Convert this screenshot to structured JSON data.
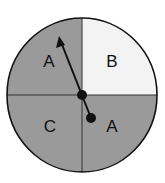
{
  "spinner": {
    "colors": {
      "shaded": "#9a9a9a",
      "light": "#f3f3f3",
      "stroke": "#111111"
    },
    "sections": [
      {
        "position": "top-left",
        "label": "A",
        "shaded": true
      },
      {
        "position": "top-right",
        "label": "B",
        "shaded": false
      },
      {
        "position": "bottom-left",
        "label": "C",
        "shaded": true
      },
      {
        "position": "bottom-right",
        "label": "A",
        "shaded": true
      }
    ],
    "pointer": {
      "direction": "top-left section A"
    }
  }
}
